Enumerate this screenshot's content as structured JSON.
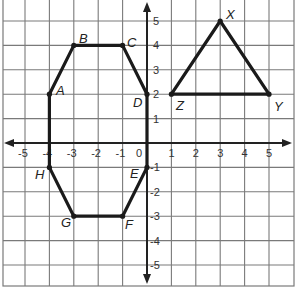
{
  "figure": {
    "type": "coordinate-grid",
    "x_range": [
      -6,
      6
    ],
    "y_range": [
      -6,
      6
    ],
    "x_ticks": [
      "-5",
      "-4",
      "-3",
      "-2",
      "-1",
      "0",
      "1",
      "2",
      "3",
      "4",
      "5"
    ],
    "y_ticks": [
      "5",
      "4",
      "3",
      "2",
      "1",
      "-1",
      "-2",
      "-3",
      "-4",
      "-5"
    ],
    "colors": {
      "grid": "#7a7a7a",
      "axis": "#222222",
      "shape": "#1a1a1a",
      "background": "#ffffff"
    }
  },
  "shapes": [
    {
      "name": "octagon",
      "vertices": [
        {
          "label": "A",
          "x": -4,
          "y": 2
        },
        {
          "label": "B",
          "x": -3,
          "y": 4
        },
        {
          "label": "C",
          "x": -1,
          "y": 4
        },
        {
          "label": "D",
          "x": 0,
          "y": 2
        },
        {
          "label": "E",
          "x": 0,
          "y": -1
        },
        {
          "label": "F",
          "x": -1,
          "y": -3
        },
        {
          "label": "G",
          "x": -3,
          "y": -3
        },
        {
          "label": "H",
          "x": -4,
          "y": -1
        }
      ]
    },
    {
      "name": "triangle",
      "vertices": [
        {
          "label": "X",
          "x": 3,
          "y": 5
        },
        {
          "label": "Y",
          "x": 5,
          "y": 2
        },
        {
          "label": "Z",
          "x": 1,
          "y": 2
        }
      ]
    }
  ],
  "labels": {
    "A": "A",
    "B": "B",
    "C": "C",
    "D": "D",
    "E": "E",
    "F": "F",
    "G": "G",
    "H": "H",
    "X": "X",
    "Y": "Y",
    "Z": "Z"
  }
}
